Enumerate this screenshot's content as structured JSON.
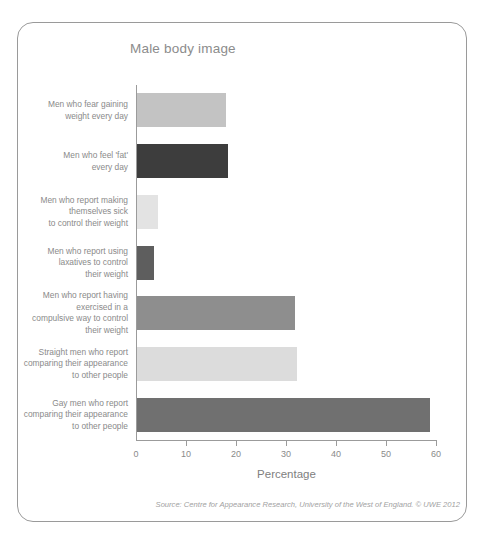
{
  "figure": {
    "title": "Male body image",
    "source_note": "Source: Centre for Appearance Research, University of the West of England. © UWE 2012",
    "frame_border_color": "#9a9a9a",
    "background_color": "#ffffff",
    "title_color": "#8c8c8c",
    "text_color": "#8a8a8a"
  },
  "chart_data": {
    "type": "bar",
    "orientation": "horizontal",
    "title": "Male body image",
    "xlabel": "Percentage",
    "ylabel": "",
    "xlim": [
      0,
      60
    ],
    "xticks": [
      0,
      10,
      20,
      30,
      40,
      50,
      60
    ],
    "xtick_labels": [
      "0",
      "10",
      "20",
      "30",
      "40",
      "50",
      "60"
    ],
    "grid": false,
    "legend": false,
    "categories": [
      "Men who fear gaining\nweight every day",
      "Men who feel 'fat'\nevery day",
      "Men who report making\nthemselves sick\nto control their weight",
      "Men who report using\nlaxatives to control\ntheir weight",
      "Men who report having\nexercised in a\ncompulsive way to control\ntheir weight",
      "Straight men who report\ncomparing their appearance\nto other people",
      "Gay men who report\ncomparing their appearance\nto other people"
    ],
    "values": [
      17.8,
      18.2,
      4.2,
      3.4,
      31.6,
      32,
      58.6
    ],
    "bar_colors": [
      "#c3c3c3",
      "#3d3d3d",
      "#e3e3e3",
      "#5e5e5e",
      "#8e8e8e",
      "#dcdcdc",
      "#707070"
    ],
    "annotations": [
      "Source: Centre for Appearance Research, University of the West of England. © UWE 2012"
    ]
  }
}
